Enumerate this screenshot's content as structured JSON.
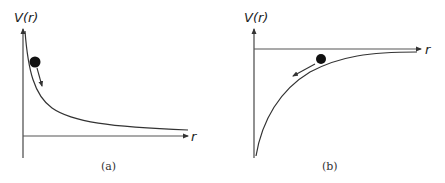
{
  "figure": {
    "panels": [
      {
        "id": "a",
        "y_axis_label": "V(r)",
        "x_axis_label": "r",
        "caption": "(a)",
        "curve": "repulsive potential, decreasing from +infinity toward 0 as r increases",
        "ball_motion": "down the slope, toward larger r"
      },
      {
        "id": "b",
        "y_axis_label": "V(r)",
        "x_axis_label": "r",
        "caption": "(b)",
        "curve": "attractive potential, rising from -infinity toward 0 as r increases",
        "ball_motion": "down the slope, toward smaller r"
      }
    ],
    "colors": {
      "line": "#333333",
      "axis": "#555555",
      "ball": "#111111"
    }
  }
}
